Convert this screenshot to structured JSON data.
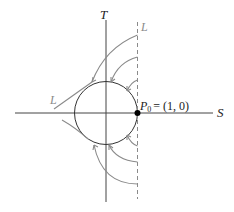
{
  "diagram": {
    "type": "phase-plane-diagram",
    "axes": {
      "horizontal_label": "S",
      "vertical_label": "T"
    },
    "labels": {
      "line_top": "L",
      "line_left": "L",
      "point": "P",
      "point_subscript": "0",
      "point_value": "= (1, 0)"
    },
    "elements": [
      {
        "name": "unit-circle",
        "desc": "circle centered at origin, radius 1"
      },
      {
        "name": "dashed-line-L",
        "desc": "vertical dashed line S = 1"
      },
      {
        "name": "point-P0",
        "desc": "filled dot at (1, 0)"
      },
      {
        "name": "tangent-line-L",
        "desc": "line tangent to circle on upper left"
      },
      {
        "name": "trajectory-curves",
        "desc": "gray arcs from dashed line toward circle with arrowheads",
        "count": 7
      }
    ],
    "colors": {
      "axis": "#333333",
      "circle": "#333333",
      "trajectory": "#8a8a8a",
      "dashed": "#8a8a8a",
      "point": "#000000"
    }
  }
}
